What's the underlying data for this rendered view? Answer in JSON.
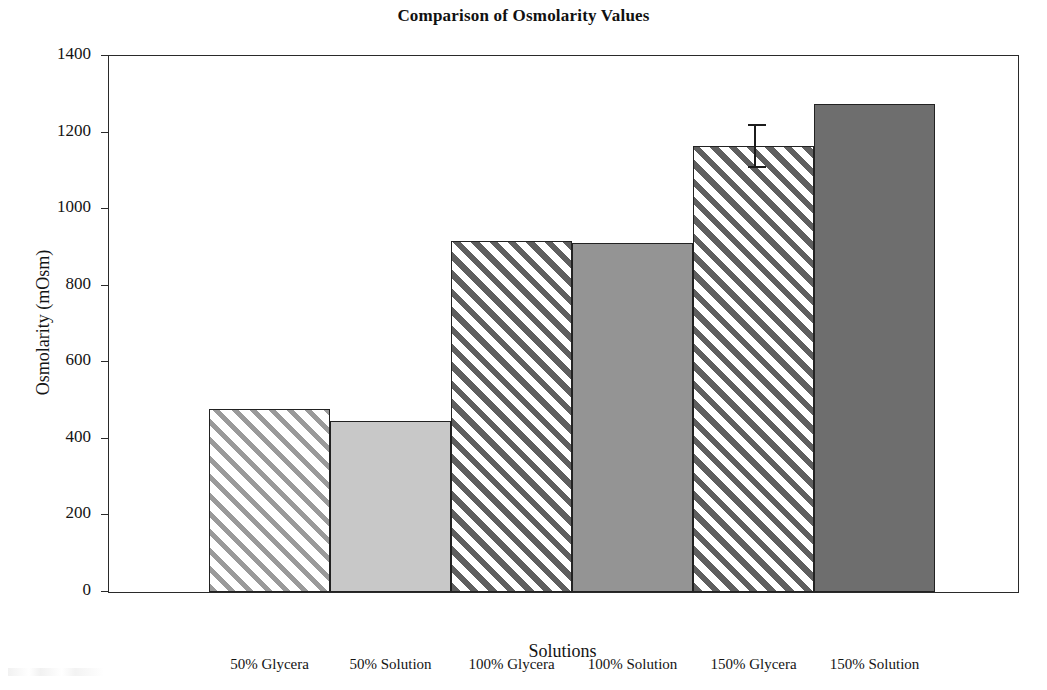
{
  "chart_data": {
    "type": "bar",
    "title": "Comparison of Osmolarity Values",
    "xlabel": "Solutions",
    "ylabel": "Osmolarity (mOsm)",
    "categories": [
      "50% Glycera",
      "50% Solution",
      "100% Glycera",
      "100% Solution",
      "150% Glycera",
      "150% Solution"
    ],
    "values": [
      478,
      447,
      917,
      911,
      1165,
      1275
    ],
    "errors": [
      null,
      null,
      null,
      null,
      55,
      null
    ],
    "ylim": [
      0,
      1400
    ],
    "yticks": [
      0,
      200,
      400,
      600,
      800,
      1000,
      1200,
      1400
    ],
    "ytick_labels": [
      "0",
      "200",
      "400",
      "600",
      "800",
      "1000",
      "1200",
      "1400"
    ],
    "grid": false,
    "legend": "none",
    "bar_styles": [
      "hatch-light",
      "solid-light",
      "hatch-dark",
      "solid-mid",
      "hatch-dark",
      "solid-dark"
    ],
    "colors": {
      "hatch_light": "#9a9a9a",
      "solid_light": "#c8c8c8",
      "hatch_dark": "#5f5f5f",
      "solid_mid": "#949494",
      "solid_dark": "#6e6e6e",
      "axis": "#2a2a2a",
      "text": "#141414",
      "background": "#ffffff"
    }
  }
}
